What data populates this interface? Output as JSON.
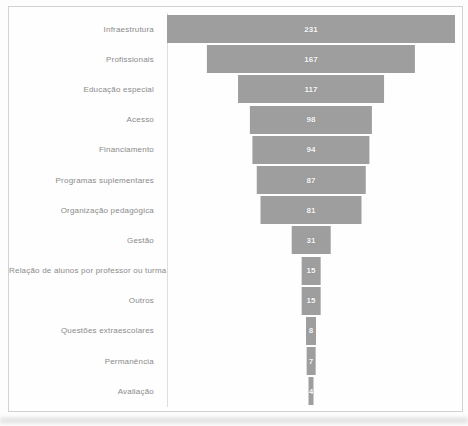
{
  "chart_data": {
    "type": "bar",
    "subtype": "funnel-centered-horizontal",
    "title": "",
    "xlabel": "",
    "ylabel": "",
    "grid": "off",
    "legend": "none",
    "categories": [
      "Infraestrutura",
      "Profissionais",
      "Educação especial",
      "Acesso",
      "Financiamento",
      "Programas suplementares",
      "Organização pedagógica",
      "Gestão",
      "Relação de alunos por professor ou turma",
      "Outros",
      "Questões extraescolares",
      "Permanência",
      "Avaliação"
    ],
    "values": [
      231,
      167,
      117,
      98,
      94,
      87,
      81,
      31,
      15,
      15,
      8,
      7,
      4
    ],
    "max_value": 231,
    "value_labels_shown": true,
    "bar_color": "#9e9e9e",
    "value_label_color": "#f7f7f7",
    "category_label_color": "#8a8a8a",
    "frame_border_color": "#d2d2d2",
    "axis_line_color": "#dedede"
  }
}
